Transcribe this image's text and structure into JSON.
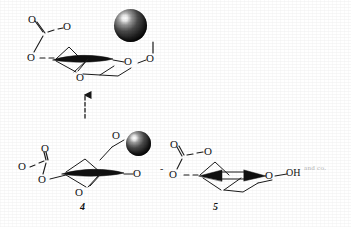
{
  "figure": {
    "kind": "chemical-reaction-scheme",
    "background_color": "#ffffff",
    "ink_color": "#141414"
  },
  "structures": [
    {
      "id": "transition-state",
      "label": "",
      "atoms": [
        {
          "name": "carboxylate-o-top",
          "text": "O"
        },
        {
          "name": "carboxylate-o-right",
          "text": "O"
        },
        {
          "name": "carboxylate-o-left",
          "text": "O"
        },
        {
          "name": "ring-o-bottom",
          "text": "O"
        },
        {
          "name": "ring-o-right",
          "text": "O"
        },
        {
          "name": "linker-o",
          "text": "O"
        }
      ],
      "bead": {
        "name": "resin-bead",
        "color": "#111111"
      }
    },
    {
      "id": "compound-4",
      "label": "4",
      "atoms": [
        {
          "name": "free-o-left",
          "text": "O"
        },
        {
          "name": "carboxylate-o-top",
          "text": "O"
        },
        {
          "name": "carboxylate-o-bottom",
          "text": "O"
        },
        {
          "name": "ring-o-bottom",
          "text": "O"
        },
        {
          "name": "ring-o-right",
          "text": "O"
        },
        {
          "name": "linker-o",
          "text": "O"
        }
      ],
      "bead": {
        "name": "resin-bead",
        "color": "#111111"
      }
    },
    {
      "id": "compound-5",
      "label": "5",
      "charge": "-",
      "atoms": [
        {
          "name": "carboxylate-o-top",
          "text": "O"
        },
        {
          "name": "carboxylate-o-right",
          "text": "O"
        },
        {
          "name": "carboxylate-o-left",
          "text": "O"
        },
        {
          "name": "ring-o-right",
          "text": "O"
        },
        {
          "name": "hydroxyl",
          "text": "OH"
        }
      ]
    }
  ],
  "arrow": {
    "name": "reaction-arrow",
    "direction": "up"
  },
  "annotations": [
    {
      "name": "faint-marginal-note",
      "text": "and co."
    }
  ]
}
